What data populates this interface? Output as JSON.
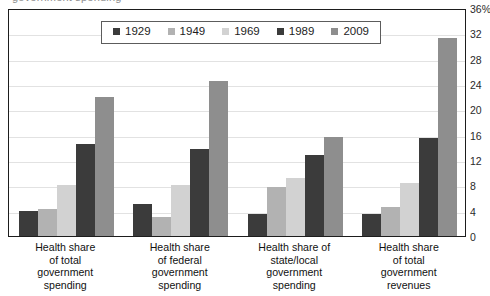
{
  "clipped_header_text": "government spending",
  "chart_data": {
    "type": "bar",
    "title": "",
    "subtitle": "",
    "xlabel": "",
    "ylabel": "",
    "ylim": [
      0,
      36
    ],
    "ytick_step": 4,
    "grid": true,
    "legend_position": "top-center",
    "axis_side": "right",
    "ytick_labels": [
      "36%",
      "32",
      "28",
      "24",
      "20",
      "16",
      "12",
      "8",
      "4",
      "0"
    ],
    "ytick_values": [
      36,
      32,
      28,
      24,
      20,
      16,
      12,
      8,
      4,
      0
    ],
    "categories": [
      "Health share of total government spending",
      "Health share of federal government spending",
      "Health share of state/local government spending",
      "Health share of total government revenues"
    ],
    "category_lines": [
      [
        "Health share",
        "of total",
        "government",
        "spending"
      ],
      [
        "Health share",
        "of federal",
        "government",
        "spending"
      ],
      [
        "Health share of",
        "state/local",
        "government",
        "spending"
      ],
      [
        "Health share",
        "of total",
        "government",
        "revenues"
      ]
    ],
    "series": [
      {
        "name": "1929",
        "color": "#3b3b3b",
        "values": [
          4.0,
          5.0,
          3.5,
          3.5
        ]
      },
      {
        "name": "1949",
        "color": "#b2b2b2",
        "values": [
          4.2,
          3.0,
          7.8,
          4.6
        ]
      },
      {
        "name": "1969",
        "color": "#d2d2d2",
        "values": [
          8.0,
          8.0,
          9.2,
          8.3
        ]
      },
      {
        "name": "1989",
        "color": "#3b3b3b",
        "values": [
          14.5,
          13.8,
          12.8,
          15.4
        ]
      },
      {
        "name": "2009",
        "color": "#8e8e8e",
        "values": [
          22.0,
          24.5,
          15.6,
          31.2
        ]
      }
    ]
  }
}
